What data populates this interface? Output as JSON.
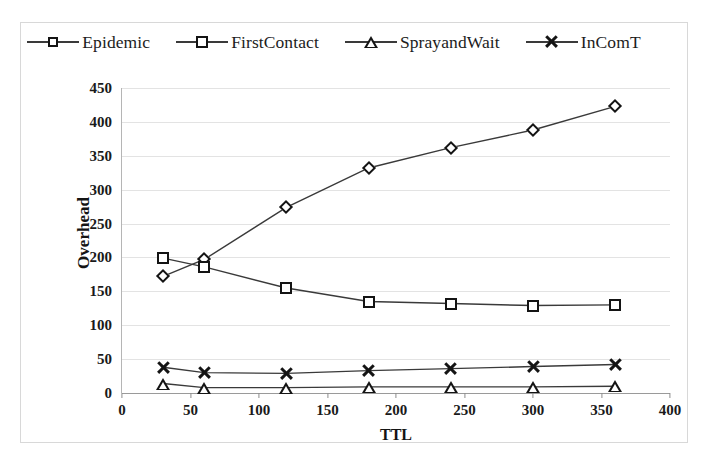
{
  "chart_data": {
    "type": "line",
    "title": "",
    "xlabel": "TTL",
    "ylabel": "Overhead",
    "x": [
      30,
      60,
      120,
      180,
      240,
      300,
      360
    ],
    "xlim": [
      0,
      400
    ],
    "ylim": [
      0,
      450
    ],
    "xticks": [
      0,
      50,
      100,
      150,
      200,
      250,
      300,
      350,
      400
    ],
    "yticks": [
      0,
      50,
      100,
      150,
      200,
      250,
      300,
      350,
      400,
      450
    ],
    "grid": true,
    "legend_position": "top",
    "series": [
      {
        "name": "Epidemic",
        "marker": "diamond",
        "color": "#141414",
        "values": [
          172,
          197,
          274,
          332,
          362,
          388,
          423
        ]
      },
      {
        "name": "FirstContact",
        "marker": "square",
        "color": "#141414",
        "values": [
          199,
          186,
          155,
          135,
          132,
          129,
          130
        ]
      },
      {
        "name": "SprayandWait",
        "marker": "triangle",
        "color": "#141414",
        "values": [
          14,
          8,
          8,
          9,
          9,
          9,
          10
        ]
      },
      {
        "name": "InComT",
        "marker": "x",
        "color": "#141414",
        "values": [
          38,
          30,
          29,
          33,
          36,
          39,
          42
        ]
      }
    ]
  },
  "axes": {
    "y_label": "Overhead",
    "x_label": "TTL",
    "y_tick_labels": [
      "0",
      "50",
      "100",
      "150",
      "200",
      "250",
      "300",
      "350",
      "400",
      "450"
    ],
    "x_tick_labels": [
      "0",
      "50",
      "100",
      "150",
      "200",
      "250",
      "300",
      "350",
      "400"
    ]
  },
  "legend": {
    "items": [
      {
        "label": "Epidemic",
        "marker": "diamond-marker-icon"
      },
      {
        "label": "FirstContact",
        "marker": "square-marker-icon"
      },
      {
        "label": "SprayandWait",
        "marker": "triangle-marker-icon"
      },
      {
        "label": "InComT",
        "marker": "x-marker-icon"
      }
    ]
  },
  "style": {
    "line_color": "#3a3a3a",
    "marker_color": "#141414",
    "grid_color": "#e3e3e3",
    "frame_color": "#d8d8d8",
    "background": "#ffffff"
  }
}
